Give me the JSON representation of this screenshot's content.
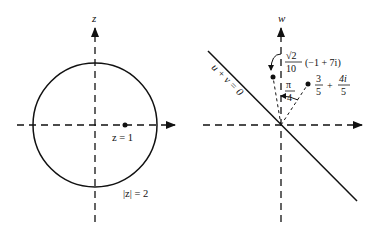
{
  "left_panel": {
    "axis_label": "z",
    "point_label": "z = 1",
    "circle_label": "|z| = 2",
    "circle": {
      "cx": 95,
      "cy": 125,
      "r": 62
    },
    "point": {
      "x": 125,
      "y": 125
    }
  },
  "right_panel": {
    "axis_label": "w",
    "line_label": "u + v = 0",
    "angle_label_num": "π",
    "angle_label_den": "4",
    "point_a": {
      "label_frac1_num": "3",
      "label_frac1_den": "5",
      "label_plus": "+",
      "label_frac2_num": "4i",
      "label_frac2_den": "5",
      "x": 308,
      "y": 84
    },
    "point_b": {
      "label_frac_num": "√2",
      "label_frac_den": "10",
      "label_tail": "(−1 + 7i)",
      "x": 273,
      "y": 77
    }
  },
  "colors": {
    "ink": "#111111",
    "background": "#ffffff"
  }
}
